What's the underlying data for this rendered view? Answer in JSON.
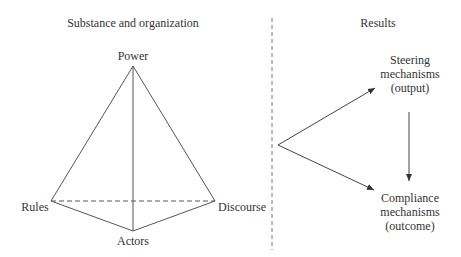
{
  "left_section": {
    "title": "Substance and organization",
    "vertices": {
      "top": "Power",
      "left": "Rules",
      "right": "Discourse",
      "bottom": "Actors"
    }
  },
  "right_section": {
    "title": "Results",
    "steering": [
      "Steering",
      "mechanisms",
      "(output)"
    ],
    "compliance": [
      "Compliance",
      "mechanisms",
      "(outcome)"
    ]
  },
  "colors": {
    "line": "#444444",
    "text": "#333333",
    "background": "#ffffff"
  }
}
